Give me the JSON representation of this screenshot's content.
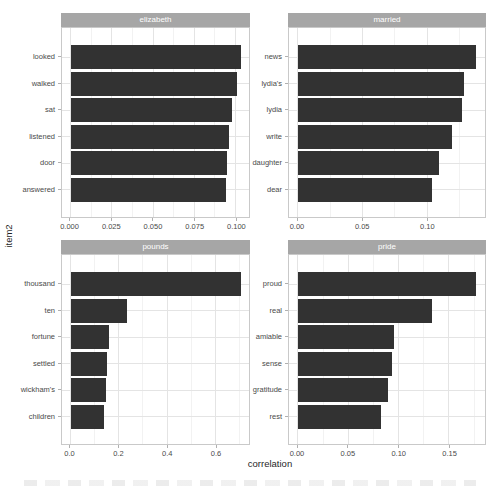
{
  "figure": {
    "x_axis_title": "correlation",
    "y_axis_title": "item2"
  },
  "colors": {
    "bar_fill": "#323232",
    "strip_background": "#a6a6a6",
    "strip_text": "#ffffff",
    "panel_border": "#c9c9c9",
    "grid_major": "#e4e4e4",
    "grid_minor": "#f2f2f2",
    "tick_label": "#4a4a4a",
    "axis_title": "#1f1f1f"
  },
  "chart_data": [
    {
      "type": "bar",
      "orientation": "horizontal",
      "facet": "elizabeth",
      "categories": [
        "looked",
        "walked",
        "sat",
        "listened",
        "door",
        "answered"
      ],
      "values": [
        0.103,
        0.101,
        0.098,
        0.096,
        0.095,
        0.094
      ],
      "xlabel": "correlation",
      "ylabel": "item2",
      "xlim": [
        -0.00515,
        0.10815
      ],
      "x_ticks": [
        0,
        0.025,
        0.05,
        0.075,
        0.1
      ],
      "x_tick_labels": [
        "0.000",
        "0.025",
        "0.050",
        "0.075",
        "0.100"
      ],
      "grid": "on",
      "legend": "none"
    },
    {
      "type": "bar",
      "orientation": "horizontal",
      "facet": "married",
      "categories": [
        "news",
        "lydia's",
        "lydia",
        "write",
        "daughter",
        "dear"
      ],
      "values": [
        0.138,
        0.129,
        0.127,
        0.119,
        0.109,
        0.104
      ],
      "xlabel": "correlation",
      "ylabel": "item2",
      "xlim": [
        -0.0069,
        0.1449
      ],
      "x_ticks": [
        0,
        0.05,
        0.1
      ],
      "x_tick_labels": [
        "0.00",
        "0.05",
        "0.10"
      ],
      "grid": "on",
      "legend": "none"
    },
    {
      "type": "bar",
      "orientation": "horizontal",
      "facet": "pounds",
      "categories": [
        "thousand",
        "ten",
        "fortune",
        "settled",
        "wickham's",
        "children"
      ],
      "values": [
        0.704,
        0.233,
        0.161,
        0.153,
        0.145,
        0.137
      ],
      "xlabel": "correlation",
      "ylabel": "item2",
      "xlim": [
        -0.0352,
        0.7392
      ],
      "x_ticks": [
        0,
        0.2,
        0.4,
        0.6
      ],
      "x_tick_labels": [
        "0.0",
        "0.2",
        "0.4",
        "0.6"
      ],
      "grid": "on",
      "legend": "none"
    },
    {
      "type": "bar",
      "orientation": "horizontal",
      "facet": "pride",
      "categories": [
        "proud",
        "real",
        "amiable",
        "sense",
        "gratitude",
        "rest"
      ],
      "values": [
        0.177,
        0.133,
        0.095,
        0.093,
        0.089,
        0.083
      ],
      "xlabel": "correlation",
      "ylabel": "item2",
      "xlim": [
        -0.00885,
        0.18585
      ],
      "x_ticks": [
        0,
        0.05,
        0.1,
        0.15
      ],
      "x_tick_labels": [
        "0.00",
        "0.05",
        "0.10",
        "0.15"
      ],
      "grid": "on",
      "legend": "none"
    }
  ]
}
